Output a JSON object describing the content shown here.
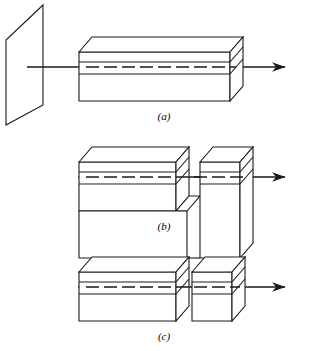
{
  "figure": {
    "width": 317,
    "height": 351,
    "background_color": "#ffffff",
    "stroke_color": "#1a1a1a",
    "fill_color": "#ffffff",
    "stroke_width": 1.1
  },
  "panels": [
    {
      "id": "a",
      "caption": "(a)",
      "description": "Intact rectangular block with vertical plane at left and axis arrow exiting right",
      "has_screen_plane": true,
      "block_state": "intact"
    },
    {
      "id": "b",
      "caption": "(b)",
      "description": "Block partially cut: narrow vertical slot separates upper portions, still joined at base",
      "has_screen_plane": false,
      "block_state": "slotted"
    },
    {
      "id": "c",
      "caption": "(c)",
      "description": "Block fully separated into two independent pieces with a gap between them",
      "has_screen_plane": false,
      "block_state": "separated"
    }
  ],
  "elements": {
    "screen_plane_label": "vertical-plane",
    "axis_label": "axis-line",
    "arrow_label": "axis-arrowhead",
    "block_label": "rectangular-block",
    "dashed_center_line": "hidden-centerline",
    "gap_label": "separation-gap"
  },
  "captions": {
    "a": "(a)",
    "b": "(b)",
    "c": "(c)"
  }
}
